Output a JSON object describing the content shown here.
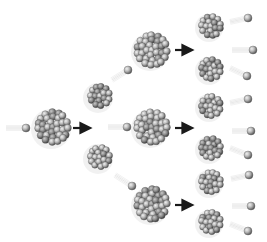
{
  "diagram": {
    "title": "",
    "colors": {
      "background": "#ffffff",
      "nucleon_light": "#d8d8d8",
      "nucleon_mid": "#a8a8a8",
      "nucleon_dark": "#5a5a5a",
      "arrow": "#1a1a1a",
      "trail": "#e6e6e6"
    },
    "nuclei": [
      {
        "id": "n0",
        "x": 53,
        "y": 127,
        "r": 18,
        "generation": 0
      },
      {
        "id": "n1a",
        "x": 100,
        "y": 96,
        "r": 13,
        "generation": 1,
        "type": "fragment"
      },
      {
        "id": "n1b",
        "x": 100,
        "y": 157,
        "r": 13,
        "generation": 1,
        "type": "fragment"
      },
      {
        "id": "n2a",
        "x": 152,
        "y": 50,
        "r": 17,
        "generation": 1
      },
      {
        "id": "n2b",
        "x": 152,
        "y": 127,
        "r": 17,
        "generation": 1
      },
      {
        "id": "n2c",
        "x": 152,
        "y": 204,
        "r": 17,
        "generation": 1
      },
      {
        "id": "f1",
        "x": 211,
        "y": 26,
        "r": 12,
        "generation": 2,
        "type": "fragment"
      },
      {
        "id": "f2",
        "x": 211,
        "y": 69,
        "r": 12,
        "generation": 2,
        "type": "fragment"
      },
      {
        "id": "f3",
        "x": 211,
        "y": 106,
        "r": 12,
        "generation": 2,
        "type": "fragment"
      },
      {
        "id": "f4",
        "x": 211,
        "y": 148,
        "r": 12,
        "generation": 2,
        "type": "fragment"
      },
      {
        "id": "f5",
        "x": 211,
        "y": 182,
        "r": 12,
        "generation": 2,
        "type": "fragment"
      },
      {
        "id": "f6",
        "x": 211,
        "y": 222,
        "r": 12,
        "generation": 2,
        "type": "fragment"
      }
    ],
    "neutrons": [
      {
        "x": 26,
        "y": 128,
        "tx": 6,
        "ty": 128
      },
      {
        "x": 128,
        "y": 70,
        "tx": 112,
        "ty": 80
      },
      {
        "x": 127,
        "y": 127,
        "tx": 108,
        "ty": 127
      },
      {
        "x": 132,
        "y": 186,
        "tx": 115,
        "ty": 175
      },
      {
        "x": 248,
        "y": 18,
        "tx": 230,
        "ty": 22
      },
      {
        "x": 253,
        "y": 50,
        "tx": 232,
        "ty": 50
      },
      {
        "x": 247,
        "y": 76,
        "tx": 230,
        "ty": 68
      },
      {
        "x": 248,
        "y": 99,
        "tx": 230,
        "ty": 103
      },
      {
        "x": 251,
        "y": 131,
        "tx": 232,
        "ty": 131
      },
      {
        "x": 248,
        "y": 155,
        "tx": 230,
        "ty": 148
      },
      {
        "x": 249,
        "y": 175,
        "tx": 231,
        "ty": 179
      },
      {
        "x": 251,
        "y": 206,
        "tx": 232,
        "ty": 206
      },
      {
        "x": 248,
        "y": 231,
        "tx": 230,
        "ty": 224
      }
    ],
    "arrows": [
      {
        "x1": 73,
        "y1": 128,
        "x2": 90,
        "y2": 128
      },
      {
        "x1": 175,
        "y1": 50,
        "x2": 192,
        "y2": 50
      },
      {
        "x1": 175,
        "y1": 128,
        "x2": 192,
        "y2": 128
      },
      {
        "x1": 175,
        "y1": 205,
        "x2": 192,
        "y2": 205
      }
    ]
  }
}
